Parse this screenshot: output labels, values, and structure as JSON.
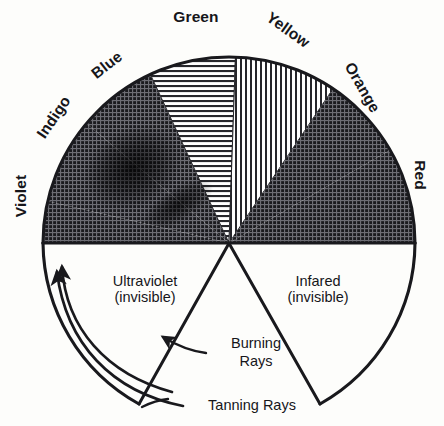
{
  "diagram": {
    "type": "radial-spectrum-diagram",
    "canvas": {
      "width": 444,
      "height": 426,
      "background": "#fdfdfb"
    },
    "geometry": {
      "center_x": 229,
      "center_y": 243,
      "radius": 186,
      "visible_arc_start_deg": 180,
      "visible_arc_end_deg": 360
    },
    "ink_color": "#19191d",
    "paper_color": "#fdfdfb"
  },
  "spectrum": {
    "band_labels": [
      {
        "name": "violet-label",
        "text": "Violet",
        "rotation": -90,
        "x": 26,
        "y": 196,
        "mid_angle_deg": 174
      },
      {
        "name": "indigo-label",
        "text": "Indigo",
        "rotation": -56,
        "x": 58,
        "y": 120,
        "mid_angle_deg": 150
      },
      {
        "name": "blue-label",
        "text": "Blue",
        "rotation": -38,
        "x": 110,
        "y": 69,
        "mid_angle_deg": 128
      },
      {
        "name": "green-label",
        "text": "Green",
        "rotation": 0,
        "x": 196,
        "y": 22,
        "mid_angle_deg": 100
      },
      {
        "name": "yellow-label",
        "text": "Yellow",
        "rotation": 36,
        "x": 285,
        "y": 34,
        "mid_angle_deg": 70
      },
      {
        "name": "orange-label",
        "text": "Orange",
        "rotation": 60,
        "x": 358,
        "y": 90,
        "mid_angle_deg": 42
      },
      {
        "name": "red-label",
        "text": "Red",
        "rotation": 90,
        "x": 415,
        "y": 175,
        "mid_angle_deg": 12
      }
    ],
    "bands": [
      {
        "key": "violet",
        "label": "Violet",
        "start_deg": 180,
        "end_deg": 167,
        "fill": "crosshatch-dark"
      },
      {
        "key": "indigo",
        "label": "Indigo",
        "start_deg": 167,
        "end_deg": 140,
        "fill": "crosshatch-dark"
      },
      {
        "key": "blue",
        "label": "Blue",
        "start_deg": 140,
        "end_deg": 115,
        "fill": "crosshatch-dark"
      },
      {
        "key": "green",
        "label": "Green",
        "start_deg": 115,
        "end_deg": 88,
        "fill": "horizontal-lines"
      },
      {
        "key": "yellow",
        "label": "Yellow",
        "start_deg": 88,
        "end_deg": 56,
        "fill": "vertical-lines"
      },
      {
        "key": "orange",
        "label": "Orange",
        "start_deg": 56,
        "end_deg": 30,
        "fill": "crosshatch-dark"
      },
      {
        "key": "red",
        "label": "Red",
        "start_deg": 30,
        "end_deg": 0,
        "fill": "crosshatch-dark"
      }
    ]
  },
  "invisible_regions": [
    {
      "name": "ultraviolet-region",
      "line1": "Ultraviolet",
      "line2": "(invisible)",
      "x": 145,
      "y": 286,
      "side": "left"
    },
    {
      "name": "infrared-region",
      "line1": "Infared",
      "line2": "(invisible)",
      "x": 318,
      "y": 286,
      "side": "right"
    }
  ],
  "annotations": [
    {
      "name": "burning-rays-annotation",
      "line1": "Burning",
      "line2": "Rays",
      "x": 256,
      "y": 348
    },
    {
      "name": "tanning-rays-annotation",
      "line1": "Tanning Rays",
      "line2": "",
      "x": 198,
      "y": 406
    }
  ],
  "legend_note": {
    "visible_spectrum": "Violet, Indigo, Blue, Green, Yellow, Orange, Red",
    "invisible_left": "Ultraviolet (invisible)",
    "invisible_right": "Infared (invisible)"
  }
}
